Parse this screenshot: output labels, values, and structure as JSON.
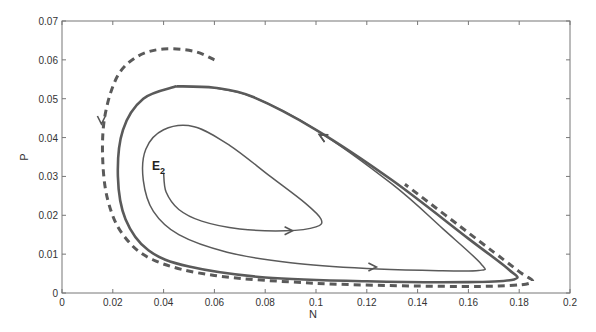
{
  "chart_data": {
    "type": "line",
    "title": "",
    "xlabel": "N",
    "ylabel": "P",
    "xlim": [
      0,
      0.2
    ],
    "ylim": [
      0,
      0.07
    ],
    "grid": false,
    "legend": null,
    "x_ticks": [
      "0",
      "0.02",
      "0.04",
      "0.06",
      "0.08",
      "0.1",
      "0.12",
      "0.14",
      "0.16",
      "0.18",
      "0.2"
    ],
    "y_ticks": [
      "0",
      "0.01",
      "0.02",
      "0.03",
      "0.04",
      "0.05",
      "0.06",
      "0.07"
    ],
    "annotations": [
      {
        "text": "E",
        "subscript": "2",
        "x": 0.038,
        "y": 0.033,
        "description": "equilibrium point E2"
      }
    ],
    "series": [
      {
        "name": "trajectory from E2 (solid, spiralling out)",
        "style": "solid",
        "points": [
          [
            0.04,
            0.031
          ],
          [
            0.041,
            0.026
          ],
          [
            0.046,
            0.0215
          ],
          [
            0.055,
            0.0185
          ],
          [
            0.07,
            0.0165
          ],
          [
            0.088,
            0.016
          ],
          [
            0.1,
            0.017
          ],
          [
            0.102,
            0.019
          ],
          [
            0.096,
            0.023
          ],
          [
            0.082,
            0.03
          ],
          [
            0.066,
            0.038
          ],
          [
            0.052,
            0.0428
          ],
          [
            0.04,
            0.042
          ],
          [
            0.033,
            0.037
          ],
          [
            0.032,
            0.029
          ],
          [
            0.036,
            0.021
          ],
          [
            0.046,
            0.015
          ],
          [
            0.065,
            0.0105
          ],
          [
            0.09,
            0.0078
          ],
          [
            0.12,
            0.0063
          ],
          [
            0.145,
            0.0058
          ],
          [
            0.164,
            0.0058
          ],
          [
            0.165,
            0.0075
          ],
          [
            0.15,
            0.0165
          ],
          [
            0.13,
            0.028
          ],
          [
            0.1,
            0.042
          ],
          [
            0.075,
            0.0505
          ],
          [
            0.06,
            0.0528
          ]
        ],
        "arrows": [
          [
            0.09,
            0.016,
            "right"
          ],
          [
            0.123,
            0.0067,
            "right"
          ],
          [
            0.102,
            0.0405,
            "up-left"
          ]
        ]
      },
      {
        "name": "stable limit cycle (solid, outer)",
        "style": "solid",
        "points": [
          [
            0.045,
            0.0532
          ],
          [
            0.032,
            0.05
          ],
          [
            0.024,
            0.042
          ],
          [
            0.022,
            0.03
          ],
          [
            0.025,
            0.019
          ],
          [
            0.034,
            0.011
          ],
          [
            0.05,
            0.0068
          ],
          [
            0.08,
            0.004
          ],
          [
            0.12,
            0.003
          ],
          [
            0.16,
            0.0028
          ],
          [
            0.178,
            0.0035
          ],
          [
            0.176,
            0.006
          ],
          [
            0.16,
            0.014
          ],
          [
            0.13,
            0.029
          ],
          [
            0.1,
            0.042
          ],
          [
            0.075,
            0.0505
          ],
          [
            0.06,
            0.0528
          ],
          [
            0.045,
            0.0532
          ]
        ],
        "arrows": [
          [
            0.102,
            0.0405,
            "up-left"
          ]
        ]
      },
      {
        "name": "trajectory from outside (dashed, approaching)",
        "style": "dashed",
        "points": [
          [
            0.06,
            0.06
          ],
          [
            0.052,
            0.0622
          ],
          [
            0.04,
            0.0628
          ],
          [
            0.03,
            0.061
          ],
          [
            0.022,
            0.056
          ],
          [
            0.017,
            0.046
          ],
          [
            0.016,
            0.035
          ],
          [
            0.018,
            0.024
          ],
          [
            0.024,
            0.015
          ],
          [
            0.036,
            0.0085
          ],
          [
            0.06,
            0.0045
          ],
          [
            0.1,
            0.0025
          ],
          [
            0.14,
            0.0018
          ],
          [
            0.172,
            0.0018
          ],
          [
            0.185,
            0.0028
          ],
          [
            0.18,
            0.0055
          ],
          [
            0.165,
            0.013
          ],
          [
            0.135,
            0.028
          ]
        ],
        "arrows": [
          [
            0.0155,
            0.044,
            "down"
          ]
        ]
      }
    ]
  }
}
